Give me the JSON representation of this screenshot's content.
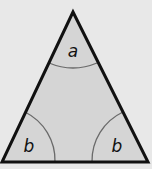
{
  "diagram": {
    "type": "isosceles-triangle",
    "colors": {
      "background": "#e8e8e8",
      "triangle_fill": "#d5d5d5",
      "triangle_stroke": "#111111",
      "arc_stroke": "#6a6a6a",
      "label": "#111111"
    },
    "vertices": {
      "apex": {
        "x": 73,
        "y": 12
      },
      "base_left": {
        "x": 2,
        "y": 162
      },
      "base_right": {
        "x": 148,
        "y": 162
      }
    },
    "angles": [
      {
        "vertex": "apex",
        "label": "a"
      },
      {
        "vertex": "base_left",
        "label": "b"
      },
      {
        "vertex": "base_right",
        "label": "b"
      }
    ]
  }
}
